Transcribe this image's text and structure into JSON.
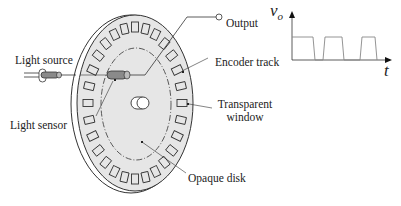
{
  "labels": {
    "light_source": "Light source",
    "light_sensor": "Light sensor",
    "output": "Output",
    "encoder_track": "Encoder track",
    "transparent_window_line1": "Transparent",
    "transparent_window_line2": "window",
    "opaque_disk": "Opaque disk"
  },
  "waveform": {
    "y_label": "v",
    "y_subscript": "o",
    "x_label": "t",
    "pulses": 3
  },
  "colors": {
    "disk_fill": "#e6e6e6",
    "stroke": "#333333",
    "sensor_fill": "#8a8a8a",
    "background": "#ffffff"
  }
}
